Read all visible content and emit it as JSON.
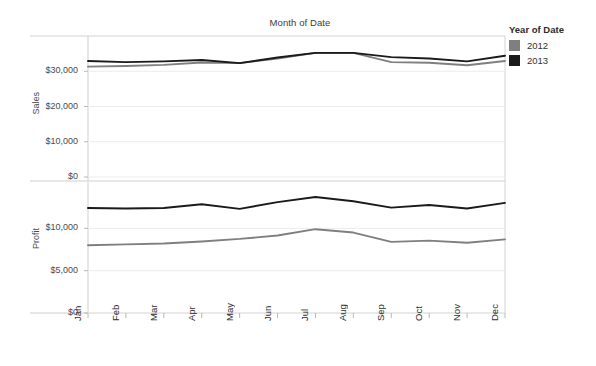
{
  "header": {
    "title": "Month of Date"
  },
  "legend": {
    "title": "Year of Date",
    "position": "right",
    "items": [
      {
        "label": "2012",
        "color": "#7f7f7f"
      },
      {
        "label": "2013",
        "color": "#1a1a1a"
      }
    ]
  },
  "panes": [
    {
      "name": "sales",
      "axis_title": "Sales",
      "yticks": [
        "$0",
        "$10,000",
        "$20,000",
        "$30,000"
      ]
    },
    {
      "name": "profit",
      "axis_title": "Profit",
      "yticks": [
        "$0",
        "$5,000",
        "$10,000"
      ]
    }
  ],
  "xticks": [
    "Jan",
    "Feb",
    "Mar",
    "Apr",
    "May",
    "Jun",
    "Jul",
    "Aug",
    "Sep",
    "Oct",
    "Nov",
    "Dec"
  ],
  "chart_data": [
    {
      "type": "line",
      "title": "Month of Date",
      "pane": "Sales",
      "xlabel": "",
      "ylabel": "Sales",
      "ylim": [
        0,
        40000
      ],
      "yticks": [
        0,
        10000,
        20000,
        30000
      ],
      "ytick_labels": [
        "$0",
        "$10,000",
        "$20,000",
        "$30,000"
      ],
      "grid": true,
      "legend_position": "right",
      "categories": [
        "Jan",
        "Feb",
        "Mar",
        "Apr",
        "May",
        "Jun",
        "Jul",
        "Aug",
        "Sep",
        "Oct",
        "Nov",
        "Dec"
      ],
      "series": [
        {
          "name": "2012",
          "color": "#7f7f7f",
          "values": [
            31300,
            31500,
            31800,
            32500,
            32300,
            33600,
            35200,
            35200,
            32600,
            32400,
            31700,
            32900
          ]
        },
        {
          "name": "2013",
          "color": "#1a1a1a",
          "values": [
            32900,
            32600,
            32800,
            33200,
            32300,
            33900,
            35200,
            35200,
            34000,
            33600,
            32800,
            34400
          ]
        }
      ]
    },
    {
      "type": "line",
      "title": "Month of Date",
      "pane": "Profit",
      "xlabel": "",
      "ylabel": "Profit",
      "ylim": [
        0,
        15000
      ],
      "yticks": [
        0,
        5000,
        10000
      ],
      "ytick_labels": [
        "$0",
        "$5,000",
        "$10,000"
      ],
      "grid": true,
      "legend_position": "right",
      "categories": [
        "Jan",
        "Feb",
        "Mar",
        "Apr",
        "May",
        "Jun",
        "Jul",
        "Aug",
        "Sep",
        "Oct",
        "Nov",
        "Dec"
      ],
      "series": [
        {
          "name": "2012",
          "color": "#7f7f7f",
          "values": [
            8000,
            8100,
            8200,
            8450,
            8750,
            9150,
            9900,
            9500,
            8400,
            8550,
            8300,
            8700
          ]
        },
        {
          "name": "2013",
          "color": "#1a1a1a",
          "values": [
            12400,
            12350,
            12400,
            12850,
            12300,
            13100,
            13700,
            13200,
            12450,
            12750,
            12350,
            13000
          ]
        }
      ]
    }
  ],
  "geometry": {
    "plot_left": 88,
    "plot_right": 505,
    "sales_top": 36,
    "sales_bottom": 177,
    "profit_top": 186,
    "profit_bottom": 313
  }
}
